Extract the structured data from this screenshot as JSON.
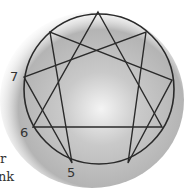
{
  "diagram": {
    "type": "enneagram",
    "circle": {
      "cx": 99,
      "cy": 89,
      "r": 75
    },
    "points": [
      {
        "id": 9,
        "x": 98,
        "y": 12
      },
      {
        "id": 1,
        "x": 146,
        "y": 32
      },
      {
        "id": 2,
        "x": 172,
        "y": 80
      },
      {
        "id": 3,
        "x": 162,
        "y": 127
      },
      {
        "id": 4,
        "x": 128,
        "y": 163
      },
      {
        "id": 5,
        "x": 72,
        "y": 163
      },
      {
        "id": 6,
        "x": 33,
        "y": 127
      },
      {
        "id": 7,
        "x": 24,
        "y": 77
      },
      {
        "id": 8,
        "x": 50,
        "y": 32
      }
    ],
    "triangle": [
      9,
      3,
      6
    ],
    "hexad": [
      1,
      4,
      2,
      8,
      5,
      7
    ],
    "visible_labels": [
      {
        "text": "7",
        "x": 10,
        "y": 70
      },
      {
        "text": "6",
        "x": 20,
        "y": 125
      },
      {
        "text": "5",
        "x": 67,
        "y": 165
      }
    ],
    "text_fragments": [
      {
        "text": "r",
        "x": 0,
        "y": 153
      },
      {
        "text": "nk",
        "x": 0,
        "y": 171
      }
    ]
  }
}
